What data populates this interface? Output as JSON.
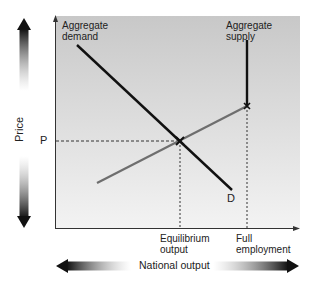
{
  "diagram": {
    "type": "aggregate demand / aggregate supply diagram",
    "y_axis": {
      "label": "Price",
      "tick": "P"
    },
    "x_axis": {
      "label": "National output",
      "ticks": [
        "Equilibrium output",
        "Full employment"
      ]
    },
    "curves": {
      "demand": {
        "label_line1": "Aggregate",
        "label_line2": "demand",
        "end_label": "D"
      },
      "supply": {
        "label_line1": "Aggregate",
        "label_line2": "supply"
      }
    },
    "labels": {
      "price": "Price",
      "p": "P",
      "equilibrium_line1": "Equilibrium",
      "equilibrium_line2": "output",
      "full_line1": "Full",
      "full_line2": "employment",
      "national_output": "National output"
    },
    "colors": {
      "background_top": "#c9c9c9",
      "background_bottom": "#f2f2f2",
      "demand_line": "#111111",
      "supply_line": "#6e6e6e",
      "axis": "#333333"
    }
  }
}
